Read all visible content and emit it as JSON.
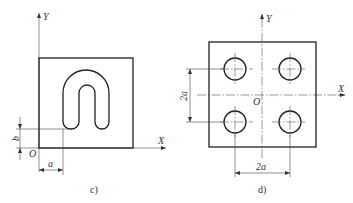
{
  "figures": [
    {
      "id": "c",
      "caption": "c)",
      "axes": {
        "x_label": "X",
        "y_label": "Y",
        "origin_label": "O"
      },
      "dimensions": [
        {
          "label": "a",
          "orientation": "horizontal",
          "meaning": "x-offset of slot from origin"
        },
        {
          "label": "b",
          "orientation": "vertical",
          "meaning": "y-offset of slot bottom from origin"
        }
      ],
      "features": [
        "square plate",
        "U-shaped slot"
      ]
    },
    {
      "id": "d",
      "caption": "d)",
      "axes": {
        "x_label": "X",
        "y_label": "Y",
        "origin_label": "O"
      },
      "dimensions": [
        {
          "label": "2a",
          "orientation": "vertical",
          "meaning": "vertical hole spacing"
        },
        {
          "label": "2a",
          "orientation": "horizontal",
          "meaning": "horizontal hole spacing"
        }
      ],
      "features": [
        "square plate",
        "4 circular holes symmetric about origin"
      ]
    }
  ],
  "colors": {
    "line": "#222222",
    "background": "#ffffff"
  }
}
